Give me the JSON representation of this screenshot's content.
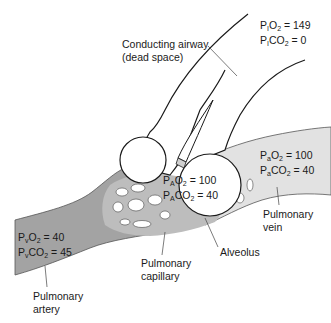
{
  "labels": {
    "conducting_airway_line1": "Conducting airway",
    "conducting_airway_line2": "(dead space)",
    "pulmonary_vein_line1": "Pulmonary",
    "pulmonary_vein_line2": "vein",
    "alveolus": "Alveolus",
    "pulmonary_capillary_line1": "Pulmonary",
    "pulmonary_capillary_line2": "capillary",
    "pulmonary_artery_line1": "Pulmonary",
    "pulmonary_artery_line2": "artery"
  },
  "inspired": {
    "o2": {
      "P": "P",
      "sub": "I",
      "gas": "O",
      "gas_sub": "2",
      "value": " = 149"
    },
    "co2": {
      "P": "P",
      "sub": "I",
      "gas": "CO",
      "gas_sub": "2",
      "value": " = 0"
    }
  },
  "alveolar": {
    "o2": {
      "P": "P",
      "sub": "A",
      "gas": "O",
      "gas_sub": "2",
      "value": " = 100"
    },
    "co2": {
      "P": "P",
      "sub": "A",
      "gas": "CO",
      "gas_sub": "2",
      "value": " = 40"
    }
  },
  "arterial": {
    "o2": {
      "P": "P",
      "sub": "a",
      "gas": "O",
      "gas_sub": "2",
      "value": " = 100"
    },
    "co2": {
      "P": "P",
      "sub": "a",
      "gas": "CO",
      "gas_sub": "2",
      "value": " = 40"
    }
  },
  "venous": {
    "o2": {
      "P": "P",
      "sub": "v",
      "gas": "O",
      "gas_sub": "2",
      "value": " = 40"
    },
    "co2": {
      "P": "P",
      "sub": "v",
      "gas": "CO",
      "gas_sub": "2",
      "value": " = 45"
    }
  },
  "colors": {
    "artery_fill": "#a3a3a3",
    "vein_fill": "#e2e2e2",
    "outline": "#1a1a1a",
    "background": "#ffffff"
  }
}
